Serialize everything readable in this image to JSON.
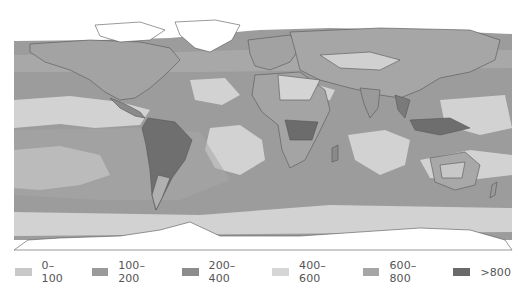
{
  "map": {
    "type": "world-choropleth",
    "projection": "equirectangular",
    "background_color": "#ffffff",
    "coastline_color": "#555555",
    "ice_color": "#ffffff"
  },
  "legend": {
    "items": [
      {
        "label": "0–100",
        "color": "#c8c8c8"
      },
      {
        "label": "100–200",
        "color": "#9a9a9a"
      },
      {
        "label": "200–400",
        "color": "#8c8c8c"
      },
      {
        "label": "400–600",
        "color": "#d6d6d6"
      },
      {
        "label": "600–800",
        "color": "#a6a6a6"
      },
      {
        "label": ">800",
        "color": "#6a6a6a"
      }
    ]
  }
}
